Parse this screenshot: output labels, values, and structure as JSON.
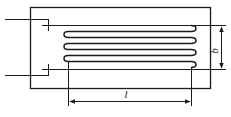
{
  "diagram": {
    "type": "strain-gauge-schematic",
    "labels": {
      "width": "b",
      "length": "l"
    },
    "grid_loops": 4,
    "colors": {
      "line": "#1a1a1a",
      "background": "#ffffff"
    }
  }
}
